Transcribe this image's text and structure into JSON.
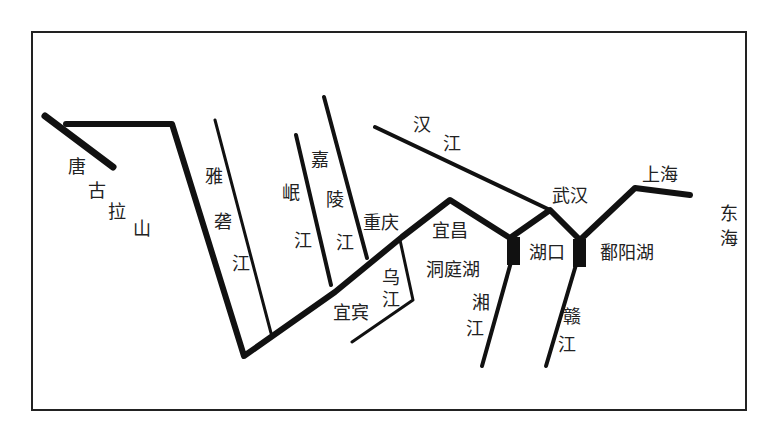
{
  "diagram": {
    "type": "river-system-schematic",
    "labels": {
      "tanggula_1": "唐",
      "tanggula_2": "古",
      "tanggula_3": "拉",
      "tanggula_4": "山",
      "yalong_1": "雅",
      "yalong_2": "砻",
      "yalong_3": "江",
      "min_1": "岷",
      "min_2": "江",
      "jialing_1": "嘉",
      "jialing_2": "陵",
      "jialing_3": "江",
      "han_1": "汉",
      "han_2": "江",
      "chongqing": "重庆",
      "yichang": "宜昌",
      "yibin": "宜宾",
      "wu_1": "乌",
      "wu_2": "江",
      "dongting": "洞庭湖",
      "xiang_1": "湘",
      "xiang_2": "江",
      "hukou": "湖口",
      "wuhan": "武汉",
      "poyang": "鄱阳湖",
      "gan_1": "赣",
      "gan_2": "江",
      "shanghai": "上海",
      "donghai_1": "东",
      "donghai_2": "海"
    },
    "colors": {
      "line": "#111111",
      "text": "#222222",
      "background": "#ffffff"
    }
  }
}
